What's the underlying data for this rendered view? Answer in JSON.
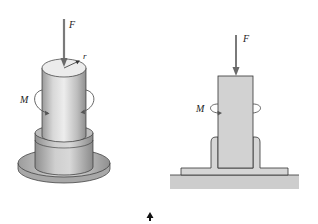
{
  "figure_left": {
    "title": "3D view of cylindrical shaft in flanged base",
    "labels": {
      "force": "F",
      "radius": "r",
      "moment": "M"
    }
  },
  "figure_right": {
    "title": "Cross-section view of shaft in flanged base",
    "labels": {
      "force": "F",
      "moment": "M"
    }
  },
  "colors": {
    "metal_light": "#e4e4e4",
    "metal_mid": "#c4c4c4",
    "metal_dark": "#8a8a8a",
    "outline": "#333333",
    "arrow": "#777777",
    "section_fill": "#d4d4d4",
    "ground": "#c8c8c8"
  }
}
